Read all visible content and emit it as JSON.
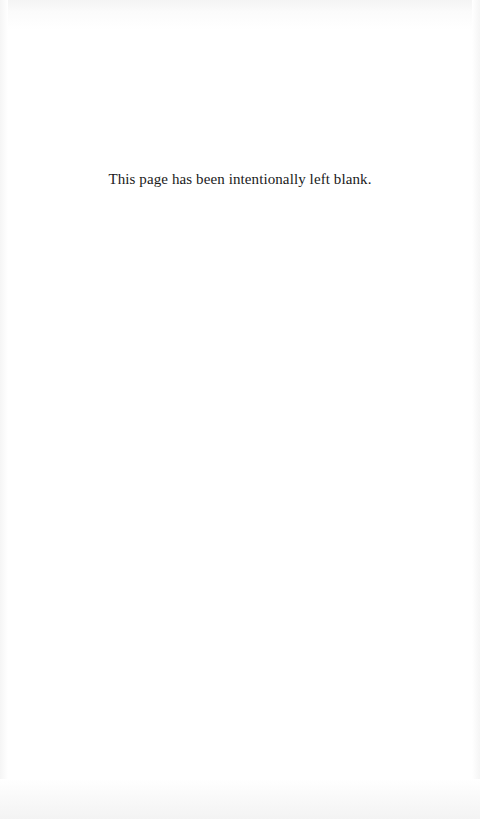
{
  "page": {
    "notice": "This page has been intentionally left blank.",
    "background_color": "#ffffff",
    "text_color": "#1a1a1a"
  }
}
